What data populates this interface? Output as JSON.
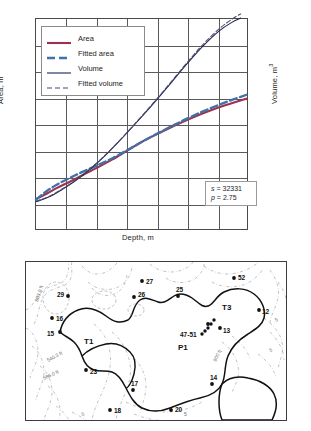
{
  "chart_data": {
    "type": "line",
    "title": "",
    "xlabel": "Depth, m",
    "ylabel_left": "Area, m",
    "ylabel_left_sup": "2",
    "ylabel_right": "Volume, m",
    "ylabel_right_sup": "3",
    "grid": true,
    "grid_cols": 7,
    "grid_rows": 8,
    "xticks": [],
    "yticks": [],
    "legend_position": "top-left",
    "annotation": {
      "s_label": "s",
      "s_eq": "=",
      "s_value": "32331",
      "p_label": "p",
      "p_eq": "=",
      "p_value": "2.75"
    },
    "series": [
      {
        "name": "Area",
        "color": "#9c3250",
        "style": "solid",
        "points": [
          [
            0.0,
            0.143
          ],
          [
            0.05,
            0.168
          ],
          [
            0.1,
            0.196
          ],
          [
            0.16,
            0.225
          ],
          [
            0.22,
            0.256
          ],
          [
            0.29,
            0.292
          ],
          [
            0.36,
            0.33
          ],
          [
            0.43,
            0.372
          ],
          [
            0.5,
            0.414
          ],
          [
            0.58,
            0.455
          ],
          [
            0.66,
            0.494
          ],
          [
            0.74,
            0.53
          ],
          [
            0.82,
            0.562
          ],
          [
            0.9,
            0.59
          ],
          [
            1.0,
            0.622
          ]
        ]
      },
      {
        "name": "Fitted area",
        "color": "#3f72a8",
        "style": "dashed",
        "points": [
          [
            0.0,
            0.14
          ],
          [
            0.05,
            0.18
          ],
          [
            0.1,
            0.212
          ],
          [
            0.16,
            0.243
          ],
          [
            0.22,
            0.272
          ],
          [
            0.29,
            0.303
          ],
          [
            0.36,
            0.336
          ],
          [
            0.43,
            0.374
          ],
          [
            0.5,
            0.414
          ],
          [
            0.58,
            0.457
          ],
          [
            0.66,
            0.498
          ],
          [
            0.74,
            0.537
          ],
          [
            0.82,
            0.572
          ],
          [
            0.9,
            0.604
          ],
          [
            1.0,
            0.64
          ]
        ]
      },
      {
        "name": "Volume",
        "color": "#1c2356",
        "style": "solid",
        "points": [
          [
            0.0,
            0.13
          ],
          [
            0.06,
            0.152
          ],
          [
            0.12,
            0.186
          ],
          [
            0.19,
            0.232
          ],
          [
            0.26,
            0.288
          ],
          [
            0.33,
            0.352
          ],
          [
            0.4,
            0.424
          ],
          [
            0.47,
            0.5
          ],
          [
            0.55,
            0.59
          ],
          [
            0.63,
            0.684
          ],
          [
            0.71,
            0.78
          ],
          [
            0.79,
            0.87
          ],
          [
            0.87,
            0.945
          ],
          [
            0.93,
            0.985
          ],
          [
            0.97,
            1.005
          ]
        ]
      },
      {
        "name": "Fitted volume",
        "color": "#4b4b63",
        "style": "dashed",
        "points": [
          [
            0.0,
            0.132
          ],
          [
            0.06,
            0.154
          ],
          [
            0.12,
            0.188
          ],
          [
            0.19,
            0.234
          ],
          [
            0.26,
            0.29
          ],
          [
            0.33,
            0.354
          ],
          [
            0.4,
            0.426
          ],
          [
            0.47,
            0.503
          ],
          [
            0.55,
            0.593
          ],
          [
            0.63,
            0.688
          ],
          [
            0.71,
            0.785
          ],
          [
            0.79,
            0.877
          ],
          [
            0.87,
            0.955
          ],
          [
            0.93,
            1.0
          ],
          [
            0.97,
            1.024
          ]
        ]
      }
    ]
  },
  "chart": {
    "legend": [
      {
        "label": "Area",
        "swatch": "solid-maroon"
      },
      {
        "label": "Fitted area",
        "swatch": "dashed-blue"
      },
      {
        "label": "Volume",
        "swatch": "solid-navy"
      },
      {
        "label": "Fitted volume",
        "swatch": "dashed-gray"
      }
    ]
  },
  "map": {
    "zones": [
      {
        "id": "zone-t1",
        "label": "T1",
        "x": 58,
        "y": 82
      },
      {
        "id": "zone-t3",
        "label": "T3",
        "x": 196,
        "y": 48
      },
      {
        "id": "zone-p1",
        "label": "P1",
        "x": 152,
        "y": 88
      }
    ],
    "points": [
      {
        "label": "29",
        "x": 42,
        "y": 34,
        "dx": -11,
        "dy": 1
      },
      {
        "label": "27",
        "x": 116,
        "y": 19,
        "dx": 4,
        "dy": 3
      },
      {
        "label": "26",
        "x": 108,
        "y": 35,
        "dx": 4,
        "dy": 0
      },
      {
        "label": "25",
        "x": 152,
        "y": 34,
        "dx": -2,
        "dy": -4
      },
      {
        "label": "52",
        "x": 208,
        "y": 16,
        "dx": 4,
        "dy": 2
      },
      {
        "label": "16",
        "x": 26,
        "y": 56,
        "dx": 4,
        "dy": 3
      },
      {
        "label": "15",
        "x": 34,
        "y": 70,
        "dx": -13,
        "dy": 4
      },
      {
        "label": "12",
        "x": 233,
        "y": 48,
        "dx": 3,
        "dy": 4
      },
      {
        "label": "13",
        "x": 194,
        "y": 66,
        "dx": 3,
        "dy": 5
      },
      {
        "label": "47-51",
        "x": 182,
        "y": 62,
        "dx": -28,
        "dy": 13
      },
      {
        "label": "23",
        "x": 60,
        "y": 108,
        "dx": 4,
        "dy": 4
      },
      {
        "label": "17",
        "x": 107,
        "y": 128,
        "dx": -2,
        "dy": -4
      },
      {
        "label": "18",
        "x": 84,
        "y": 148,
        "dx": 4,
        "dy": 3
      },
      {
        "label": "20",
        "x": 145,
        "y": 148,
        "dx": 4,
        "dy": 2
      },
      {
        "label": "14",
        "x": 186,
        "y": 122,
        "dx": -2,
        "dy": -4
      }
    ],
    "contour_labels": [
      {
        "text": "603.0 ft",
        "x": 12,
        "y": 40,
        "rot": -72
      },
      {
        "text": "540.3 ft",
        "x": 22,
        "y": 100,
        "rot": -28
      },
      {
        "text": "586.0 ft",
        "x": 18,
        "y": 118,
        "rot": -25
      },
      {
        "text": "600 ft",
        "x": 190,
        "y": 100,
        "rot": -62
      },
      {
        "text": "5",
        "x": 250,
        "y": 60,
        "rot": -30
      },
      {
        "text": "5",
        "x": 244,
        "y": 90,
        "rot": -20
      },
      {
        "text": "5",
        "x": 158,
        "y": 154,
        "rot": 0
      },
      {
        "text": "0",
        "x": 56,
        "y": 154,
        "rot": -18
      }
    ]
  }
}
